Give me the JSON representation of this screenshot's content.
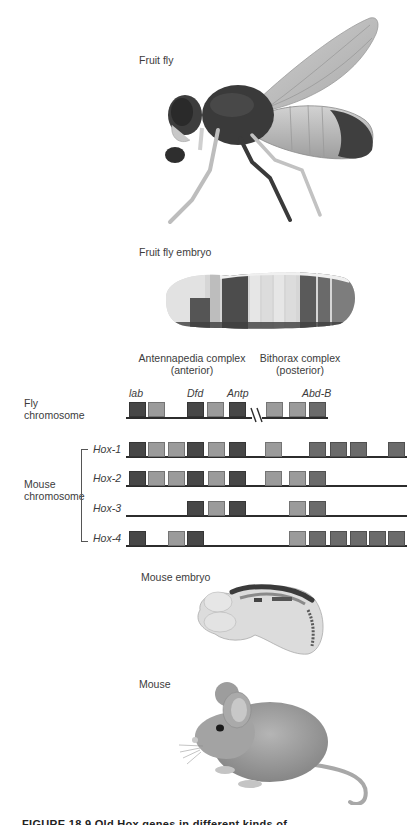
{
  "labels": {
    "fruit_fly": "Fruit fly",
    "fruit_fly_embryo": "Fruit fly embryo",
    "antennapedia_line1": "Antennapedia complex",
    "antennapedia_line2": "(anterior)",
    "bithorax_line1": "Bithorax complex",
    "bithorax_line2": "(posterior)",
    "fly_chromosome_line1": "Fly",
    "fly_chromosome_line2": "chromosome",
    "mouse_chromosome_line1": "Mouse",
    "mouse_chromosome_line2": "chromosome",
    "mouse_embryo": "Mouse embryo",
    "mouse": "Mouse",
    "caption_fragment": "FIGURE 18.9  Old Hox genes in different kinds of ..."
  },
  "colors": {
    "dark": "#474747",
    "light": "#9b9b9b",
    "medium": "#6b6b6b",
    "line": "#2c2c2c"
  },
  "fly_chromosome": {
    "gene_labels": [
      {
        "text": "lab",
        "x": 129
      },
      {
        "text": "Dfd",
        "x": 187
      },
      {
        "text": "Antp",
        "x": 227
      },
      {
        "text": "Abd-B",
        "x": 302
      }
    ],
    "boxes": [
      {
        "x": 129,
        "tone": "dark"
      },
      {
        "x": 148,
        "tone": "light"
      },
      {
        "x": 187,
        "tone": "dark"
      },
      {
        "x": 207,
        "tone": "light"
      },
      {
        "x": 229,
        "tone": "dark"
      },
      {
        "x": 266,
        "tone": "light"
      },
      {
        "x": 289,
        "tone": "light"
      },
      {
        "x": 309,
        "tone": "medium"
      }
    ],
    "break_symbol": "//"
  },
  "mouse_clusters": [
    {
      "name": "Hox-1",
      "boxes": [
        {
          "x": 129,
          "tone": "dark"
        },
        {
          "x": 148,
          "tone": "light"
        },
        {
          "x": 168,
          "tone": "light"
        },
        {
          "x": 187,
          "tone": "dark"
        },
        {
          "x": 208,
          "tone": "light"
        },
        {
          "x": 229,
          "tone": "dark"
        },
        {
          "x": 265,
          "tone": "light"
        },
        {
          "x": 309,
          "tone": "medium"
        },
        {
          "x": 330,
          "tone": "medium"
        },
        {
          "x": 350,
          "tone": "medium"
        },
        {
          "x": 388,
          "tone": "medium"
        }
      ]
    },
    {
      "name": "Hox-2",
      "boxes": [
        {
          "x": 129,
          "tone": "dark"
        },
        {
          "x": 148,
          "tone": "light"
        },
        {
          "x": 168,
          "tone": "light"
        },
        {
          "x": 187,
          "tone": "dark"
        },
        {
          "x": 208,
          "tone": "light"
        },
        {
          "x": 229,
          "tone": "dark"
        },
        {
          "x": 265,
          "tone": "light"
        },
        {
          "x": 289,
          "tone": "light"
        },
        {
          "x": 309,
          "tone": "medium"
        }
      ]
    },
    {
      "name": "Hox-3",
      "boxes": [
        {
          "x": 187,
          "tone": "dark"
        },
        {
          "x": 208,
          "tone": "light"
        },
        {
          "x": 229,
          "tone": "dark"
        },
        {
          "x": 289,
          "tone": "light"
        },
        {
          "x": 309,
          "tone": "medium"
        }
      ]
    },
    {
      "name": "Hox-4",
      "boxes": [
        {
          "x": 129,
          "tone": "dark"
        },
        {
          "x": 168,
          "tone": "light"
        },
        {
          "x": 187,
          "tone": "dark"
        },
        {
          "x": 289,
          "tone": "light"
        },
        {
          "x": 309,
          "tone": "medium"
        },
        {
          "x": 330,
          "tone": "medium"
        },
        {
          "x": 350,
          "tone": "medium"
        },
        {
          "x": 369,
          "tone": "medium"
        },
        {
          "x": 388,
          "tone": "medium"
        }
      ]
    }
  ],
  "illustrations": {
    "fruit_fly": "fruit-fly-illustration",
    "fruit_fly_embryo": "fruit-fly-embryo-illustration",
    "mouse_embryo": "mouse-embryo-illustration",
    "mouse": "mouse-illustration"
  }
}
